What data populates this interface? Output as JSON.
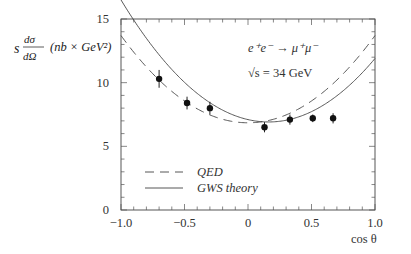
{
  "chart_data": {
    "type": "scatter",
    "title": "",
    "xlabel": "cos θ",
    "ylabel": "s dσ/dΩ  (nb × GeV²)",
    "xlim": [
      -1.0,
      1.0
    ],
    "ylim": [
      0,
      15
    ],
    "x_ticks": [
      -1.0,
      -0.5,
      0,
      0.5,
      1.0
    ],
    "x_tick_labels": [
      "−1.0",
      "−0.5",
      "0",
      "0.5",
      "1.0"
    ],
    "x_minor_step": 0.1,
    "y_ticks": [
      0,
      5,
      10,
      15
    ],
    "y_tick_labels": [
      "0",
      "5",
      "10",
      "15"
    ],
    "y_minor_step": 1,
    "grid": false,
    "annotations": [
      {
        "text": "e⁺e⁻ → μ⁺μ⁻",
        "x": -0.05,
        "y": 13.2
      },
      {
        "text": "√s = 34 GeV",
        "x": -0.05,
        "y": 11.3
      }
    ],
    "legend": {
      "position": "lower left",
      "entries": [
        {
          "label": "QED",
          "style": "dashed"
        },
        {
          "label": "GWS theory",
          "style": "solid"
        }
      ]
    },
    "series": [
      {
        "name": "data",
        "kind": "points_with_errors",
        "x": [
          -0.7,
          -0.48,
          -0.3,
          0.13,
          0.33,
          0.51,
          0.67
        ],
        "y": [
          10.3,
          8.4,
          8.0,
          6.5,
          7.1,
          7.2,
          7.2
        ],
        "yerr": [
          0.7,
          0.5,
          0.5,
          0.4,
          0.4,
          0.3,
          0.4
        ]
      },
      {
        "name": "QED",
        "kind": "curve",
        "style": "dashed",
        "formula": "A*(1+x^2)",
        "A": 6.85
      },
      {
        "name": "GWS theory",
        "kind": "curve",
        "style": "solid",
        "formula": "A*(1+x^2) + B*x",
        "A": 7.1,
        "B": -2.3
      }
    ]
  }
}
